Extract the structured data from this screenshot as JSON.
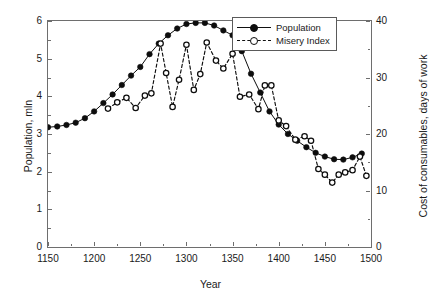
{
  "chart_data": {
    "type": "line",
    "title": "",
    "xlabel": "Year",
    "ylabel": "Population, mln",
    "y2label": "Cost of consumables, days of work",
    "xlim": [
      1150,
      1500
    ],
    "ylim": [
      0,
      6
    ],
    "y2lim": [
      0,
      40
    ],
    "xticks": [
      1150,
      1200,
      1250,
      1300,
      1350,
      1400,
      1450,
      1500
    ],
    "xticklabels": [
      "1150",
      "1200",
      "1250",
      "1300",
      "1350",
      "1400",
      "1450",
      "1500"
    ],
    "xminorticks": [
      1175,
      1225,
      1275,
      1325,
      1375,
      1425,
      1475
    ],
    "yticks": [
      0,
      1,
      2,
      3,
      4,
      5,
      6
    ],
    "yticklabels": [
      "0",
      "1",
      "2",
      "3",
      "4",
      "5",
      "6"
    ],
    "y2ticks": [
      0,
      10,
      20,
      30,
      40
    ],
    "y2ticklabels": [
      "0",
      "10",
      "20",
      "30",
      "40"
    ],
    "y2minorticks": [
      5,
      15,
      25,
      35
    ],
    "grid": false,
    "legend_position": "top-right",
    "series": [
      {
        "name": "Population",
        "axis": "left",
        "units": "mln",
        "marker": "filled-circle",
        "linestyle": "solid",
        "color": "#0d0d0d",
        "x": [
          1150,
          1160,
          1170,
          1180,
          1190,
          1200,
          1210,
          1220,
          1230,
          1240,
          1250,
          1260,
          1270,
          1280,
          1290,
          1300,
          1310,
          1320,
          1330,
          1340,
          1350,
          1360,
          1370,
          1380,
          1390,
          1400,
          1410,
          1420,
          1430,
          1440,
          1450,
          1460,
          1470,
          1480,
          1490
        ],
        "values": [
          3.18,
          3.2,
          3.24,
          3.3,
          3.42,
          3.6,
          3.82,
          4.05,
          4.3,
          4.55,
          4.78,
          5.12,
          5.4,
          5.62,
          5.8,
          5.92,
          5.95,
          5.95,
          5.88,
          5.75,
          5.62,
          5.2,
          4.6,
          4.1,
          3.6,
          3.25,
          3.0,
          2.82,
          2.65,
          2.5,
          2.4,
          2.33,
          2.32,
          2.38,
          2.48
        ]
      },
      {
        "name": "Misery Index",
        "axis": "right",
        "units": "days of work",
        "marker": "open-circle",
        "linestyle": "dashed",
        "color": "#0d0d0d",
        "x": [
          1215,
          1225,
          1235,
          1245,
          1255,
          1262,
          1272,
          1278,
          1285,
          1292,
          1300,
          1308,
          1315,
          1322,
          1332,
          1340,
          1350,
          1358,
          1368,
          1378,
          1385,
          1392,
          1400,
          1408,
          1418,
          1428,
          1435,
          1443,
          1450,
          1458,
          1465,
          1472,
          1480,
          1488,
          1495
        ],
        "values": [
          24.5,
          25.6,
          26.4,
          24.6,
          26.8,
          27.2,
          36.0,
          30.8,
          24.8,
          29.6,
          35.8,
          27.8,
          30.6,
          36.2,
          33.0,
          31.6,
          34.2,
          26.6,
          27.0,
          24.4,
          28.6,
          28.6,
          22.4,
          21.4,
          19.0,
          19.6,
          18.8,
          13.8,
          12.8,
          11.4,
          12.8,
          13.2,
          13.6,
          16.0,
          12.6
        ]
      }
    ],
    "annotations": []
  },
  "legend": {
    "entries": [
      {
        "label": "Population",
        "marker": "filled-circle-icon",
        "linestyle": "solid"
      },
      {
        "label": "Misery Index",
        "marker": "open-circle-icon",
        "linestyle": "dashed"
      }
    ]
  }
}
